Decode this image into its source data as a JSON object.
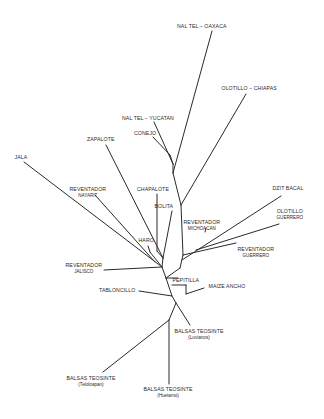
{
  "diagram": {
    "type": "unrooted-phylogenetic-tree",
    "line_color": "#2a2a2a",
    "background": "#ffffff",
    "labels": [
      {
        "id": "nal-tel-oaxaca",
        "text": "NAL TEL – OAXACA",
        "sub": "",
        "x": 202,
        "y": 26
      },
      {
        "id": "olotillo-chiapas",
        "text": "OLOTILLO – CHIAPAS",
        "sub": "",
        "x": 249,
        "y": 88
      },
      {
        "id": "nal-tel-yucatan",
        "text": "NAL TEL – YUCATAN",
        "sub": "",
        "x": 148,
        "y": 118
      },
      {
        "id": "conejo",
        "text": "CONEJO",
        "sub": "",
        "x": 145,
        "y": 133
      },
      {
        "id": "zapalote",
        "text": "ZAPALOTE",
        "sub": "",
        "x": 101,
        "y": 139
      },
      {
        "id": "jala",
        "text": "JALA",
        "sub": "",
        "x": 21,
        "y": 157
      },
      {
        "id": "reventador-nayarit",
        "text": "REVENTADOR",
        "sub": "NAYARIT",
        "x": 88,
        "y": 189
      },
      {
        "id": "chapalote",
        "text": "CHAPALOTE",
        "sub": "",
        "x": 153,
        "y": 189
      },
      {
        "id": "bolita",
        "text": "BOLITA",
        "sub": "",
        "x": 164,
        "y": 206
      },
      {
        "id": "dzit-bacal",
        "text": "DZIT BACAL",
        "sub": "",
        "x": 288,
        "y": 188
      },
      {
        "id": "olotillo-guerrero",
        "text": "OLOTILLO",
        "sub": "GUERRERO",
        "x": 290,
        "y": 211
      },
      {
        "id": "reventador-michoacan",
        "text": "REVENTADOR",
        "sub": "MICHOACAN",
        "x": 202,
        "y": 222
      },
      {
        "id": "haro",
        "text": "HARO",
        "sub": "",
        "x": 146,
        "y": 240
      },
      {
        "id": "reventador-guerrero",
        "text": "REVENTADOR",
        "sub": "GUERRERO",
        "x": 256,
        "y": 249
      },
      {
        "id": "reventador-jalisco",
        "text": "REVENTADOR",
        "sub": "JALISCO",
        "x": 84,
        "y": 265
      },
      {
        "id": "pepitilla",
        "text": "PEPITILLA",
        "sub": "",
        "x": 186,
        "y": 280
      },
      {
        "id": "maize-ancho",
        "text": "MAIZE ANCHO",
        "sub": "",
        "x": 227,
        "y": 286
      },
      {
        "id": "tabloncillo",
        "text": "TABLONCILLO",
        "sub": "",
        "x": 117,
        "y": 290
      },
      {
        "id": "balsas-teosinte-luvianos",
        "text": "BALSAS TEOSINTE",
        "sub": "(Luvianos)",
        "x": 199,
        "y": 331
      },
      {
        "id": "balsas-teosinte-teloloapan",
        "text": "BALSAS TEOSINTE",
        "sub": "(Teloloapan)",
        "x": 91,
        "y": 378
      },
      {
        "id": "balsas-teosinte-huetamo",
        "text": "BALSAS TEOSINTE",
        "sub": "(Huetamo)",
        "x": 168,
        "y": 389
      }
    ],
    "edges": [
      [
        212,
        31,
        173,
        173
      ],
      [
        246,
        94,
        181,
        205
      ],
      [
        154,
        122,
        173,
        164
      ],
      [
        153,
        137,
        170,
        155
      ],
      [
        170,
        155,
        173,
        164
      ],
      [
        173,
        164,
        173,
        173
      ],
      [
        173,
        173,
        181,
        205
      ],
      [
        181,
        205,
        183,
        255
      ],
      [
        183,
        255,
        180,
        268
      ],
      [
        106,
        145,
        163,
        258
      ],
      [
        24,
        162,
        162,
        267
      ],
      [
        95,
        195,
        155,
        262
      ],
      [
        157,
        194,
        157,
        251
      ],
      [
        157,
        251,
        163,
        258
      ],
      [
        172,
        211,
        163,
        258
      ],
      [
        163,
        258,
        162,
        267
      ],
      [
        148,
        246,
        150,
        252
      ],
      [
        150,
        252,
        162,
        267
      ],
      [
        104,
        270,
        162,
        267
      ],
      [
        162,
        267,
        166,
        278
      ],
      [
        182,
        260,
        281,
        196
      ],
      [
        205,
        232,
        206,
        228
      ],
      [
        196,
        250,
        279,
        224
      ],
      [
        183,
        255,
        236,
        243
      ],
      [
        180,
        268,
        166,
        278
      ],
      [
        166,
        278,
        178,
        278
      ],
      [
        172,
        285,
        186,
        285
      ],
      [
        186,
        285,
        186,
        294
      ],
      [
        186,
        294,
        204,
        288
      ],
      [
        139,
        291,
        172,
        296
      ],
      [
        166,
        278,
        172,
        296
      ],
      [
        172,
        296,
        176,
        303
      ],
      [
        176,
        303,
        190,
        325
      ],
      [
        176,
        303,
        169,
        320
      ],
      [
        169,
        320,
        103,
        372
      ],
      [
        169,
        320,
        169,
        384
      ]
    ]
  }
}
